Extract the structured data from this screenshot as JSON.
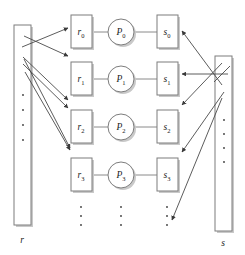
{
  "figure": {
    "type": "block-diagram",
    "title": "",
    "background_color": "#ffffff",
    "box_stroke_color": "#7d7d7d",
    "arrow_color": "#4a4a4a",
    "connector_color": "#8a8a8a",
    "text_color": "#1a1a1a"
  },
  "left_column": {
    "label": "r",
    "ellipsis_dots": 4
  },
  "right_column": {
    "label": "s",
    "ellipsis_dots": 4
  },
  "rows": [
    {
      "r_base": "r",
      "r_sub": "0",
      "p_base": "P",
      "p_sub": "0",
      "s_base": "s",
      "s_sub": "0"
    },
    {
      "r_base": "r",
      "r_sub": "1",
      "p_base": "P",
      "p_sub": "1",
      "s_base": "s",
      "s_sub": "1"
    },
    {
      "r_base": "r",
      "r_sub": "2",
      "p_base": "P",
      "p_sub": "2",
      "s_base": "s",
      "s_sub": "2"
    },
    {
      "r_base": "r",
      "r_sub": "3",
      "p_base": "P",
      "p_sub": "3",
      "s_base": "s",
      "s_sub": "3"
    }
  ],
  "ellipsis_columns": [
    {
      "name": "r-column-ellipsis",
      "dots": 3
    },
    {
      "name": "p-column-ellipsis",
      "dots": 3
    },
    {
      "name": "s-column-ellipsis",
      "dots": 3
    }
  ]
}
